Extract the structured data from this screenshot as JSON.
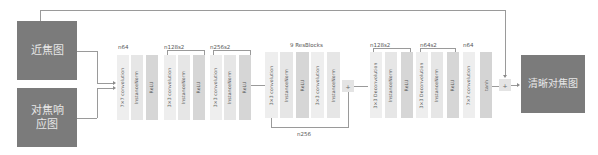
{
  "inputs": {
    "near_focus": "近焦图",
    "focus_response": "对焦响应图"
  },
  "output": {
    "label": "清晰对焦图"
  },
  "encoder": {
    "stage1": {
      "label": "n64",
      "blocks": [
        "7×7 convolution",
        "InstanceNorm",
        "ReLU"
      ]
    },
    "stage2": {
      "label": "n128s2",
      "blocks": [
        "3×3 convolution",
        "InstanceNorm",
        "ReLU"
      ]
    },
    "stage3": {
      "label": "n256s2",
      "blocks": [
        "3×3 convolution",
        "InstanceNorm",
        "ReLU"
      ]
    }
  },
  "resblock": {
    "label": "9 ResBlocks",
    "blocks": [
      "3×3 convolution",
      "InstanceNorm",
      "ReLU",
      "3×3 convolution",
      "InstanceNorm"
    ],
    "skip_label": "n256",
    "add_symbol": "+"
  },
  "decoder": {
    "stage1": {
      "label": "n128s2",
      "blocks": [
        "3×3 Deconvolution",
        "InstanceNorm",
        "ReLU"
      ]
    },
    "stage2": {
      "label": "n64s2",
      "blocks": [
        "3×3 Deconvolution",
        "InstanceNorm",
        "ReLU"
      ]
    },
    "stage3": {
      "label": "n64",
      "blocks": [
        "7×7 convolution",
        "tanh"
      ]
    }
  },
  "final_add_symbol": "+"
}
